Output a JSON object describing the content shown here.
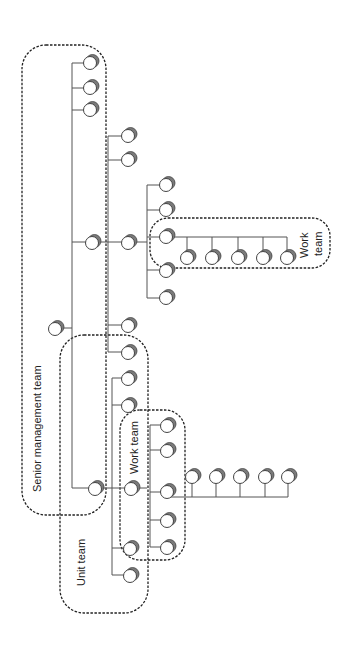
{
  "diagram": {
    "type": "organizational-team-structure",
    "orientation": "rotated-90",
    "colors": {
      "line": "#555555",
      "node_fill": "#ffffff",
      "node_shadow": "#7a7a7a",
      "box_dash": "#222222"
    },
    "groups": [
      {
        "id": "senior",
        "label": "Senior management team"
      },
      {
        "id": "unit",
        "label": "Unit team"
      },
      {
        "id": "work_lower",
        "label": "Work team"
      },
      {
        "id": "work_right_l1",
        "label": "Work"
      },
      {
        "id": "work_right_l2",
        "label": "team"
      }
    ]
  }
}
